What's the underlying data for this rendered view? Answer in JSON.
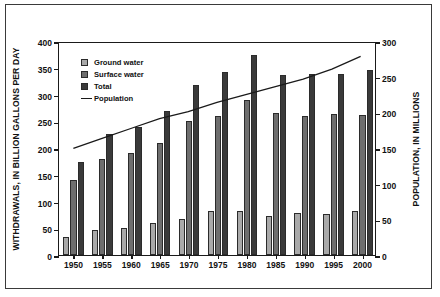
{
  "chart_data": {
    "type": "bar",
    "title": "",
    "xlabel": "",
    "ylabel": "WITHDRAWALS, IN BILLION GALLONS PER DAY",
    "y2label": "POPULATION, IN MILLIONS",
    "categories": [
      "1950",
      "1955",
      "1960",
      "1965",
      "1970",
      "1975",
      "1980",
      "1985",
      "1990",
      "1995",
      "2000"
    ],
    "ylim": [
      0,
      400
    ],
    "yticks": [
      0,
      50,
      100,
      150,
      200,
      250,
      300,
      350,
      400
    ],
    "y2lim": [
      0,
      300
    ],
    "y2ticks": [
      0,
      50,
      100,
      150,
      200,
      250,
      300
    ],
    "grid": false,
    "legend_position": "top-left",
    "series": [
      {
        "name": "Ground water",
        "type": "bar",
        "color": "#a9a9a9",
        "axis": "left",
        "values": [
          34,
          47,
          50,
          60,
          68,
          82,
          83,
          73,
          79,
          76,
          83
        ]
      },
      {
        "name": "Surface water",
        "type": "bar",
        "color": "#6e6e6e",
        "axis": "left",
        "values": [
          140,
          180,
          190,
          210,
          250,
          260,
          290,
          265,
          259,
          264,
          262
        ]
      },
      {
        "name": "Total",
        "type": "bar",
        "color": "#3a3a3a",
        "axis": "left",
        "values": [
          174,
          227,
          240,
          270,
          318,
          342,
          373,
          337,
          338,
          339,
          345
        ]
      },
      {
        "name": "Population",
        "type": "line",
        "color": "#1a1a1a",
        "axis": "right",
        "values": [
          151,
          165,
          179,
          193,
          203,
          216,
          227,
          238,
          249,
          263,
          281
        ]
      }
    ]
  },
  "legend": {
    "items": [
      {
        "label": "Ground water",
        "marker": "swatch-light"
      },
      {
        "label": "Surface water",
        "marker": "swatch-medium"
      },
      {
        "label": "Total",
        "marker": "swatch-dark"
      },
      {
        "label": "Population",
        "marker": "line"
      }
    ]
  }
}
